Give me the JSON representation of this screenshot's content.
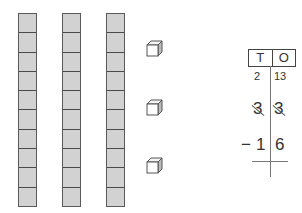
{
  "rods": {
    "count": 3,
    "segments_per_rod": 10,
    "fill_color": "#d2d2d2",
    "border_color": "#4a4a4a"
  },
  "unit_cubes": {
    "count": 3
  },
  "place_value_chart": {
    "headers": {
      "tens": "T",
      "ones": "O"
    },
    "regroup_row": {
      "tens": "2",
      "ones": "13"
    },
    "minuend_row": {
      "tens": "3",
      "ones": "3",
      "crossed_out": true
    },
    "subtrahend_row": {
      "sign": "−",
      "tens": "1",
      "ones": "6"
    }
  }
}
